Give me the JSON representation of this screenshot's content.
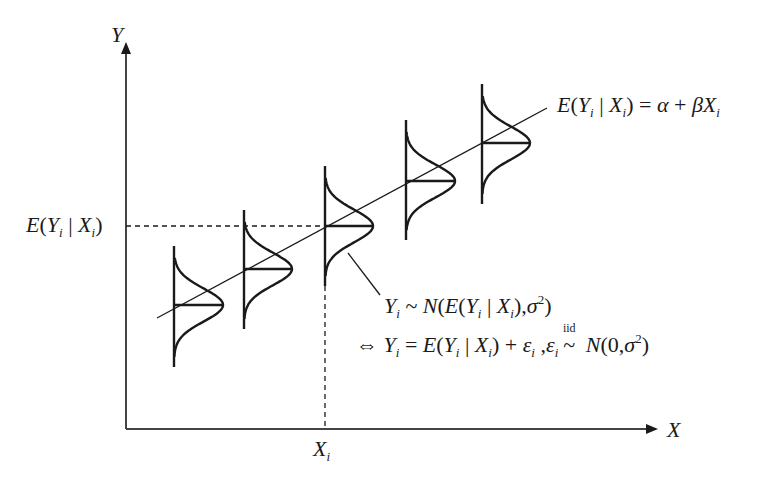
{
  "diagram": {
    "axes": {
      "x_label": "X",
      "y_label": "Y",
      "x_tick_label": "X",
      "x_tick_sub": "i",
      "y_tick_label": "E(Y | X )",
      "y_tick_parts": {
        "E": "E",
        "open": "(",
        "Y": "Y",
        "sub1": "i",
        "bar": " | ",
        "X": "X",
        "sub2": "i",
        "close": ")"
      }
    },
    "regression_line": {
      "lhs_E": "E",
      "lhs_open": "(",
      "Y": "Y",
      "sub1": "i",
      "bar": " | ",
      "X": "X",
      "sub2": "i",
      "lhs_close": ")",
      "eq": " = ",
      "alpha": "α",
      "plus": " + ",
      "beta": "β",
      "X2": "X",
      "sub3": "i"
    },
    "distribution_annotation": {
      "line1": {
        "Y": "Y",
        "sub": "i",
        "tilde": " ~ ",
        "N": "N",
        "open": "(",
        "E": "E",
        "open2": "(",
        "Y2": "Y",
        "sub2": "i",
        "bar": " | ",
        "X": "X",
        "sub3": "i",
        "close2": ")",
        "comma": ",",
        "sigma": "σ",
        "sq": "2",
        "close": ")"
      },
      "line2": {
        "iff": "⇔ ",
        "Y": "Y",
        "sub": "i",
        "eq": " = ",
        "E": "E",
        "open": "(",
        "Y2": "Y",
        "sub2": "i",
        "bar": " | ",
        "X": "X",
        "sub3": "i",
        "close": ")",
        "plus": " + ",
        "eps": "ε",
        "sub4": "i",
        "comma": " ,",
        "eps2": "ε",
        "sub5": "i",
        "iid": "iid",
        "tilde": "~",
        "N": " N",
        "args": "(0,",
        "sigma": "σ",
        "sq": "2",
        "close2": ")"
      }
    },
    "bell_curves": [
      {
        "x": 174,
        "center_y": 305,
        "top": 246,
        "bottom": 367,
        "width": 49
      },
      {
        "x": 244,
        "center_y": 269,
        "top": 210,
        "bottom": 329,
        "width": 48
      },
      {
        "x": 325,
        "center_y": 226,
        "top": 166,
        "bottom": 286,
        "width": 48
      },
      {
        "x": 406,
        "center_y": 181,
        "top": 120,
        "bottom": 240,
        "width": 49
      },
      {
        "x": 482,
        "center_y": 143,
        "top": 84,
        "bottom": 204,
        "width": 48
      }
    ],
    "colors": {
      "ink": "#1a1a1a",
      "background": "#ffffff"
    }
  }
}
